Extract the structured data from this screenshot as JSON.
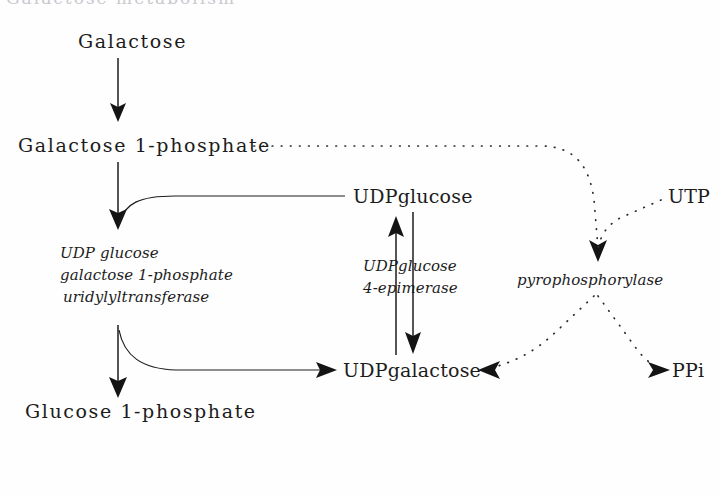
{
  "figure": {
    "title_fragment_above": "Galactose metabolism",
    "background_color": "#fefefe",
    "ink_color": "#1c1c1c"
  },
  "metabolites": {
    "galactose": "Galactose",
    "galactose_1_phosphate": "Galactose 1-phosphate",
    "glucose_1_phosphate": "Glucose 1-phosphate",
    "udp_glucose": "UDPglucose",
    "udp_galactose": "UDPgalactose",
    "utp": "UTP",
    "ppi": "PPi"
  },
  "enzymes": {
    "transferase_line1": "UDP glucose",
    "transferase_line2": "galactose 1-phosphate",
    "transferase_line3": "uridylyltransferase",
    "epimerase_line1": "UDPglucose",
    "epimerase_line2": "4-epimerase",
    "pyrophosphorylase": "pyrophosphorylase"
  },
  "arrows": {
    "galactose_to_gal1p": "solid-down-arrow",
    "gal1p_to_transferase": "solid-down-arrow",
    "transferase_to_glucose1p": "solid-down-arrow",
    "udpglucose_inlet": "solid-curve",
    "transferase_to_udpgalactose": "solid-curve-arrow",
    "udpgalactose_to_udpglucose": "solid-up-arrow",
    "udpglucose_to_udpgalactose": "solid-down-arrow",
    "gal1p_to_pyrophosphorylase": "dotted-curve-arrow",
    "utp_to_pyrophosphorylase": "dotted-curve-arrow",
    "pyrophosphorylase_to_udpgalactose": "dotted-curve-arrow",
    "pyrophosphorylase_to_ppi": "dotted-curve-arrow"
  }
}
